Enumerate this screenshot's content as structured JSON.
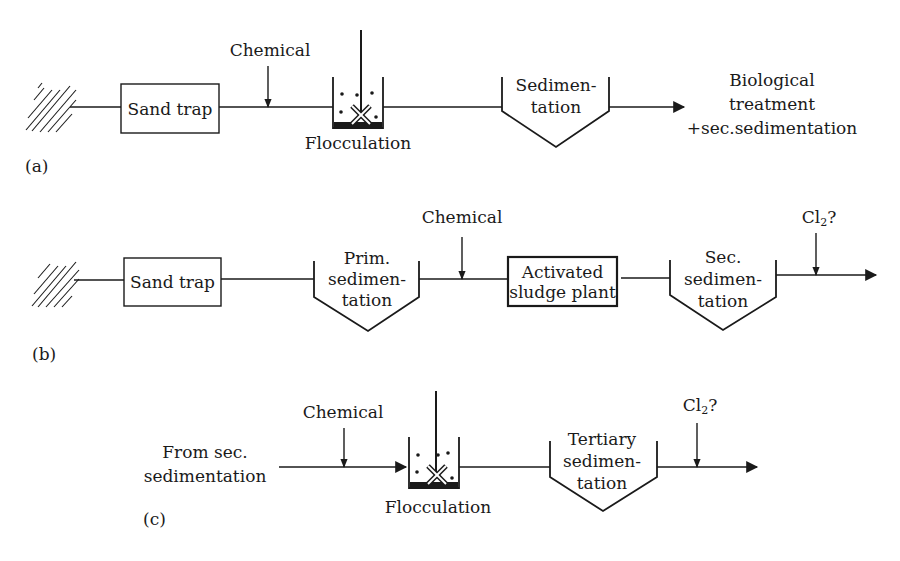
{
  "diagram": {
    "type": "process-flow",
    "panels": [
      {
        "id": "a",
        "label": "(a)",
        "nodes": [
          {
            "id": "inlet",
            "kind": "hatched-source"
          },
          {
            "id": "sand_trap",
            "kind": "box",
            "label": "Sand trap"
          },
          {
            "id": "chemical",
            "kind": "input-arrow",
            "label": "Chemical"
          },
          {
            "id": "flocculation",
            "kind": "stirred-tank",
            "label": "Flocculation"
          },
          {
            "id": "sedimentation",
            "kind": "settling-tank",
            "label_lines": [
              "Sedimen-",
              "tation"
            ]
          },
          {
            "id": "outlet",
            "kind": "text",
            "label_lines": [
              "Biological",
              "treatment",
              "+sec.sedimentation"
            ]
          }
        ]
      },
      {
        "id": "b",
        "label": "(b)",
        "nodes": [
          {
            "id": "inlet",
            "kind": "hatched-source"
          },
          {
            "id": "sand_trap",
            "kind": "box",
            "label": "Sand trap"
          },
          {
            "id": "prim_sed",
            "kind": "settling-tank",
            "label_lines": [
              "Prim.",
              "sedimen-",
              "tation"
            ]
          },
          {
            "id": "chemical",
            "kind": "input-arrow",
            "label": "Chemical"
          },
          {
            "id": "activated_sludge",
            "kind": "box-bold",
            "label_lines": [
              "Activated",
              "sludge plant"
            ]
          },
          {
            "id": "sec_sed",
            "kind": "settling-tank",
            "label_lines": [
              "Sec.",
              "sedimen-",
              "tation"
            ]
          },
          {
            "id": "cl2",
            "kind": "input-arrow",
            "label": "Cl",
            "label_sub": "2",
            "label_suffix": "?"
          }
        ]
      },
      {
        "id": "c",
        "label": "(c)",
        "nodes": [
          {
            "id": "source",
            "kind": "text",
            "label_lines": [
              "From sec.",
              "sedimentation"
            ]
          },
          {
            "id": "chemical",
            "kind": "input-arrow",
            "label": "Chemical"
          },
          {
            "id": "flocculation",
            "kind": "stirred-tank",
            "label": "Flocculation"
          },
          {
            "id": "tert_sed",
            "kind": "settling-tank",
            "label_lines": [
              "Tertiary",
              "sedimen-",
              "tation"
            ]
          },
          {
            "id": "cl2",
            "kind": "input-arrow",
            "label": "Cl",
            "label_sub": "2",
            "label_suffix": "?"
          }
        ]
      }
    ]
  },
  "style": {
    "line_color": "#1a1a1a",
    "background": "#ffffff"
  }
}
